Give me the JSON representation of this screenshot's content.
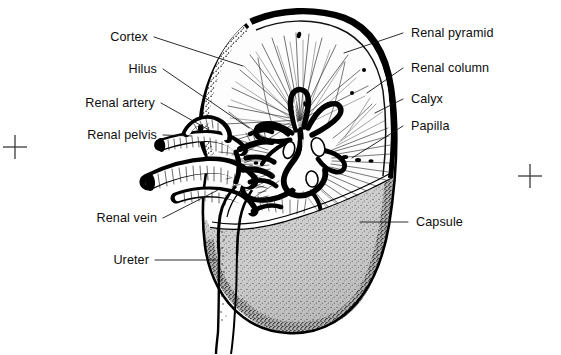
{
  "figure": {
    "background_color": "#ffffff",
    "ink_color": "#000000",
    "medulla_shade_color": "#c9c9c9",
    "cortex_fill_color": "#fbfbfb"
  },
  "labels": {
    "cortex": "Cortex",
    "hilus": "Hilus",
    "renal_artery": "Renal artery",
    "renal_pelvis": "Renal pelvis",
    "renal_vein": "Renal vein",
    "ureter": "Ureter",
    "renal_pyramid": "Renal pyramid",
    "renal_column": "Renal column",
    "calyx": "Calyx",
    "papilla": "Papilla",
    "capsule": "Capsule"
  },
  "registration_marks": [
    {
      "name": "left-registration-cross",
      "x": 15,
      "y": 147
    },
    {
      "name": "right-registration-cross",
      "x": 530,
      "y": 176
    }
  ]
}
